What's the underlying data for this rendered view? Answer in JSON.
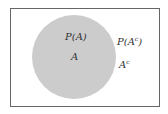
{
  "diagram": {
    "type": "venn",
    "universe": {
      "stroke": "#555555"
    },
    "set": {
      "name": "A",
      "fill": "#cccccc"
    },
    "labels": {
      "prob_a": "P(A)",
      "set_a": "A",
      "prob_a_complement": "P(A",
      "complement_sup": "c",
      "close_paren": ")",
      "complement": "A",
      "complement_label_sup": "c"
    }
  }
}
